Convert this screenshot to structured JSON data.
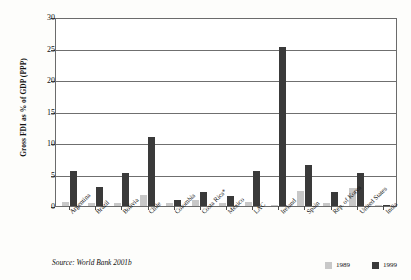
{
  "chart_data": {
    "type": "bar",
    "title": "",
    "xlabel": "",
    "ylabel": "Gross FDI as % of GDP (PPP)",
    "ylim": [
      0,
      30
    ],
    "yticks": [
      0,
      5,
      10,
      15,
      20,
      25,
      30
    ],
    "grid": true,
    "legend_position": "bottom-right",
    "categories": [
      "Argentina",
      "Brazil",
      "Bolivia",
      "Chile",
      "Colombia",
      "Costa Rica*",
      "Mexico",
      "LAC",
      "Ireland",
      "Spain",
      "Rep. of Korea",
      "United States",
      "India"
    ],
    "series": [
      {
        "name": "1989",
        "color": "#c8c8c8",
        "values": [
          0.6,
          0.4,
          0.5,
          1.7,
          0.5,
          0.9,
          0.5,
          0.6,
          0.2,
          2.4,
          0.5,
          2.8,
          0.1
        ]
      },
      {
        "name": "1999",
        "color": "#3a3a3a",
        "values": [
          5.5,
          3.0,
          5.3,
          11.0,
          0.9,
          2.2,
          1.6,
          5.6,
          25.2,
          6.5,
          2.2,
          5.2,
          0.2
        ]
      }
    ],
    "source": "Source: World Bank 2001b"
  }
}
